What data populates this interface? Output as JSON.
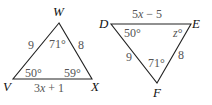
{
  "triangles": [
    {
      "name": "WVX",
      "vertices": {
        "W": "W",
        "V": "V",
        "X": "X"
      },
      "sides": {
        "WV": "9",
        "WX": "8",
        "VX_pre": "3",
        "VX_var": "x",
        "VX_post": " + 1"
      },
      "angles": {
        "W": "71°",
        "V": "50°",
        "X": "59°"
      }
    },
    {
      "name": "DEF",
      "vertices": {
        "D": "D",
        "E": "E",
        "F": "F"
      },
      "sides": {
        "DE_pre": "5",
        "DE_var": "x",
        "DE_post": " − 5",
        "DF": "9",
        "EF": "8"
      },
      "angles": {
        "D": "50°",
        "E_var": "z",
        "E_deg": "°",
        "F": "71°"
      }
    }
  ]
}
